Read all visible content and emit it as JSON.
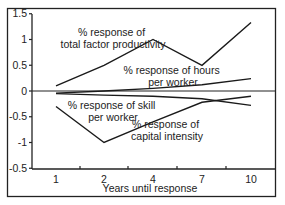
{
  "chart_data": {
    "type": "line",
    "title": "",
    "xlabel": "Years until response",
    "ylabel": "",
    "x": [
      1,
      2,
      4,
      7,
      10
    ],
    "x_tick_labels": [
      "1",
      "2",
      "4",
      "7",
      "10"
    ],
    "y_tick_labels": [
      "1.5",
      "1",
      "0.5",
      "0",
      "-0.5",
      "-1",
      "-0.5"
    ],
    "y_tick_values": [
      1.5,
      1.0,
      0.5,
      0.0,
      -0.5,
      -1.0,
      -1.5
    ],
    "ylim": [
      -1.5,
      1.5
    ],
    "grid": false,
    "legend": "inline annotations",
    "series": [
      {
        "name": "% response of total factor productivity",
        "values": [
          0.1,
          0.5,
          1.0,
          0.5,
          1.33
        ]
      },
      {
        "name": "% response of hours per worker",
        "values": [
          -0.04,
          0.0,
          0.05,
          0.12,
          0.24
        ]
      },
      {
        "name": "% response of skill per worker",
        "values": [
          -0.05,
          -0.08,
          -0.1,
          -0.15,
          -0.28
        ]
      },
      {
        "name": "% response of capital intensity",
        "values": [
          -0.3,
          -1.0,
          -0.6,
          -0.22,
          -0.1
        ]
      }
    ],
    "annotations": [
      {
        "lines": [
          "% response of",
          "total factor productivity"
        ]
      },
      {
        "lines": [
          "% response of hours",
          "per worker"
        ]
      },
      {
        "lines": [
          "% response of skill",
          "per worker"
        ]
      },
      {
        "lines": [
          "% response of",
          "capital intensity"
        ]
      }
    ]
  }
}
